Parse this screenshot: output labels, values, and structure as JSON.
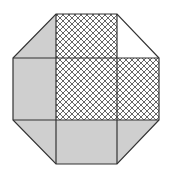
{
  "diagram": {
    "shape": "octagon",
    "grid": {
      "x": [
        13,
        56,
        117,
        159
      ],
      "y": [
        14,
        58,
        120,
        164
      ]
    },
    "colors": {
      "gray_fill": "#cfcfcf",
      "hatch_line": "#555555",
      "stroke": "#333333",
      "background": "#ffffff"
    },
    "regions": [
      {
        "id": "top-left-triangle",
        "fill": "gray"
      },
      {
        "id": "top-middle",
        "fill": "hatched"
      },
      {
        "id": "top-right-triangle",
        "fill": "white"
      },
      {
        "id": "middle-left",
        "fill": "gray"
      },
      {
        "id": "center",
        "fill": "hatched"
      },
      {
        "id": "middle-right",
        "fill": "hatched"
      },
      {
        "id": "bottom-left-triangle",
        "fill": "gray"
      },
      {
        "id": "bottom-middle",
        "fill": "gray"
      },
      {
        "id": "bottom-right-triangle",
        "fill": "gray"
      }
    ]
  }
}
